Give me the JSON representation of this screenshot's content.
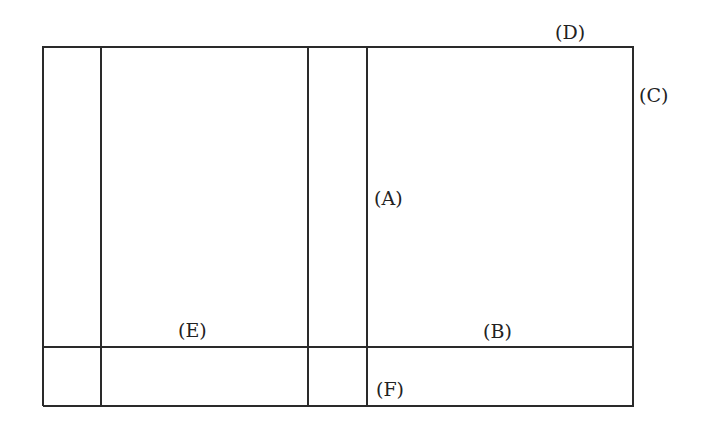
{
  "diagram": {
    "type": "partitioned-rectangle",
    "line_color": "#2a2a2a",
    "labels": {
      "A": "(A)",
      "B": "(B)",
      "C": "(C)",
      "D": "(D)",
      "E": "(E)",
      "F": "(F)"
    }
  }
}
